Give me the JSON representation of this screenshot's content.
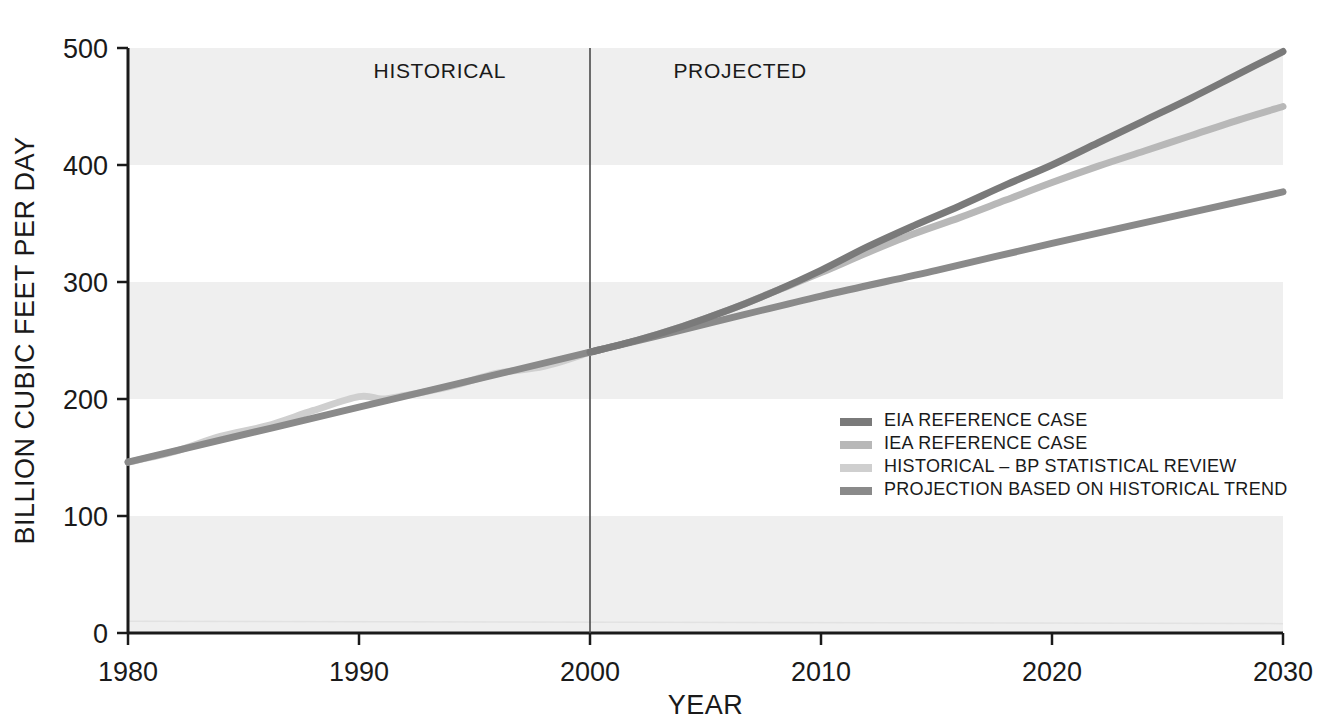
{
  "chart_data": {
    "type": "line",
    "title": "",
    "xlabel": "YEAR",
    "ylabel": "BILLION CUBIC FEET PER DAY",
    "xlim": [
      1980,
      2030
    ],
    "ylim": [
      0,
      500
    ],
    "xticks": [
      1980,
      1990,
      2000,
      2010,
      2020,
      2030
    ],
    "xtick_labels": [
      "1980",
      "1990",
      "2000",
      "2010",
      "2020",
      "2030"
    ],
    "yticks": [
      0,
      100,
      200,
      300,
      400,
      500
    ],
    "ytick_labels": [
      "0",
      "100",
      "200",
      "300",
      "400",
      "500"
    ],
    "grid": false,
    "banded_background": true,
    "band_color": "#efefef",
    "legend_position": "inside-lower-right",
    "divider_year": 2000,
    "region_labels": [
      {
        "text": "HISTORICAL",
        "year": 1993.5
      },
      {
        "text": "PROJECTED",
        "year": 2006.5
      }
    ],
    "series": [
      {
        "name": "EIA REFERENCE CASE",
        "color": "#7a7a7a",
        "x": [
          2000,
          2002,
          2004,
          2006,
          2008,
          2010,
          2012,
          2014,
          2016,
          2018,
          2020,
          2022,
          2024,
          2026,
          2028,
          2030
        ],
        "values": [
          240,
          250,
          262,
          276,
          292,
          310,
          330,
          348,
          365,
          383,
          400,
          419,
          438,
          457,
          477,
          497
        ]
      },
      {
        "name": "IEA REFERENCE CASE",
        "color": "#b8b8b8",
        "x": [
          2000,
          2002,
          2004,
          2006,
          2008,
          2010,
          2012,
          2014,
          2016,
          2018,
          2020,
          2022,
          2024,
          2026,
          2028,
          2030
        ],
        "values": [
          240,
          250,
          262,
          276,
          292,
          308,
          325,
          341,
          355,
          370,
          385,
          399,
          412,
          425,
          438,
          450
        ]
      },
      {
        "name": "HISTORICAL – BP STATISTICAL REVIEW",
        "color": "#cfcfcf",
        "x": [
          1980,
          1982,
          1984,
          1986,
          1988,
          1990,
          1991,
          1992,
          1994,
          1996,
          1998,
          2000
        ],
        "values": [
          146,
          155,
          168,
          177,
          190,
          202,
          200,
          203,
          211,
          222,
          228,
          240
        ]
      },
      {
        "name": "PROJECTION BASED ON HISTORICAL TREND",
        "color": "#8a8a8a",
        "x": [
          1980,
          1990,
          2000,
          2005,
          2010,
          2015,
          2020,
          2025,
          2030
        ],
        "values": [
          146,
          193,
          240,
          264,
          288,
          310,
          333,
          355,
          377
        ]
      }
    ]
  },
  "legend": {
    "entries": [
      {
        "label": "EIA REFERENCE CASE",
        "color": "#7a7a7a"
      },
      {
        "label": "IEA REFERENCE CASE",
        "color": "#b8b8b8"
      },
      {
        "label": "HISTORICAL – BP STATISTICAL REVIEW",
        "color": "#cfcfcf"
      },
      {
        "label": "PROJECTION BASED ON HISTORICAL TREND",
        "color": "#8a8a8a"
      }
    ]
  },
  "colors": {
    "axis": "#1a1a1a",
    "band": "#efefef",
    "background": "#ffffff",
    "divider": "#4a4a4a"
  }
}
